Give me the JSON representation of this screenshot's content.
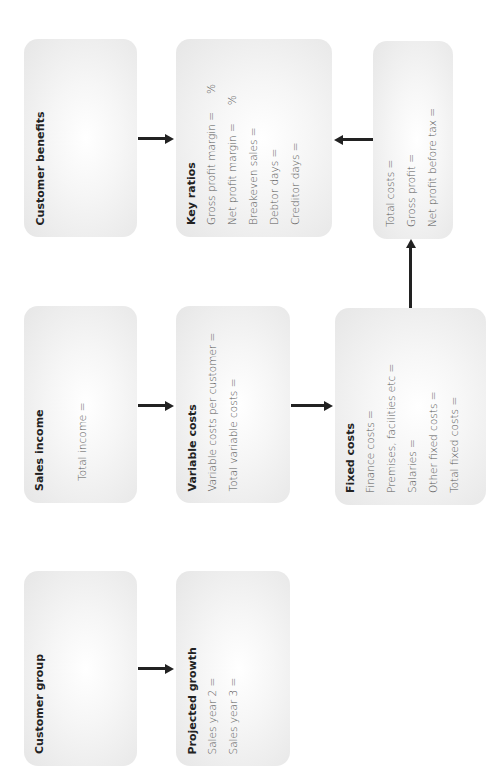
{
  "diagram": {
    "orientation": "rotated-90-ccw",
    "boxes": {
      "customer_benefits": {
        "title": "Customer benefits",
        "lines": []
      },
      "key_ratios": {
        "title": "Key ratios",
        "lines": [
          {
            "label": "Gross profit margin =",
            "suffix": "%"
          },
          {
            "label": "Net profit margin =",
            "suffix": "%"
          },
          {
            "label": "Breakeven sales =",
            "suffix": ""
          },
          {
            "label": "Debtor days =",
            "suffix": ""
          },
          {
            "label": "Creditor days =",
            "suffix": ""
          }
        ]
      },
      "totals": {
        "title": "",
        "lines": [
          {
            "label": "Total costs ="
          },
          {
            "label": "Gross profit ="
          },
          {
            "label": "Net profit before tax ="
          }
        ]
      },
      "sales_income": {
        "title": "Sales income",
        "lines": [
          {
            "label": "Total income ="
          }
        ]
      },
      "variable_costs": {
        "title": "Variable costs",
        "lines": [
          {
            "label": "Variable costs per customer ="
          },
          {
            "label": "Total variable costs ="
          }
        ]
      },
      "fixed_costs": {
        "title": "Fixed costs",
        "lines": [
          {
            "label": "Finance costs ="
          },
          {
            "label": "Premises, facilities etc ="
          },
          {
            "label": "Salaries ="
          },
          {
            "label": "Other fixed costs ="
          },
          {
            "label": "Total fixed costs ="
          }
        ]
      },
      "customer_group": {
        "title": "Customer group",
        "lines": []
      },
      "projected_growth": {
        "title": "Projected growth",
        "lines": [
          {
            "label": "Sales year 2 ="
          },
          {
            "label": "Sales year 3 ="
          }
        ]
      }
    },
    "connections": [
      {
        "from": "Customer benefits",
        "to": "Key ratios"
      },
      {
        "from": "Totals",
        "to": "Key ratios"
      },
      {
        "from": "Fixed costs",
        "to": "Totals"
      },
      {
        "from": "Sales income",
        "to": "Variable costs"
      },
      {
        "from": "Variable costs",
        "to": "Fixed costs"
      },
      {
        "from": "Customer group",
        "to": "Projected growth"
      }
    ],
    "colors": {
      "box_edge": "#e6e6e6",
      "box_center": "#ffffff",
      "arrow": "#222222",
      "text": "#555555"
    }
  }
}
